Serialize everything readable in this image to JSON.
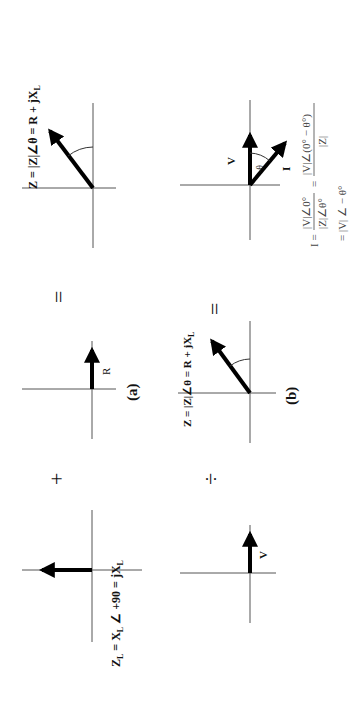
{
  "figure": {
    "rows": [
      {
        "caption": "(a)",
        "panels": [
          {
            "id": "xl",
            "label": "Z_L = X_L ∠ +90 = jX_L",
            "label_main": "Z",
            "label_sub": "L",
            "label_rest": " = X",
            "label_sub2": "L",
            "label_rest2": " ∠ +90 = jX",
            "label_sub3": "L",
            "vector": "jX_L"
          },
          {
            "id": "r",
            "label": "R",
            "vector": "R"
          },
          {
            "id": "z",
            "label": "Z = |Z|∠θ = R + jX_L",
            "label_text": "Z = |Z|∠θ = R + jX",
            "label_sub": "L",
            "vector": "Z"
          }
        ],
        "operators": [
          "+",
          "="
        ]
      },
      {
        "caption": "(b)",
        "panels": [
          {
            "id": "v",
            "label": "V",
            "vector": "V"
          },
          {
            "id": "z",
            "label": "Z = |Z|∠θ = R + jX_L",
            "label_text": "Z = |Z|∠θ = R + jX",
            "label_sub": "L",
            "vector": "Z"
          },
          {
            "id": "iv",
            "v_label": "V",
            "i_label": "I",
            "angle_label": "-θ"
          }
        ],
        "operators": [
          "÷",
          "="
        ]
      }
    ],
    "formula": {
      "lhs": "I =",
      "frac1_num": "|V|∠0°",
      "frac1_den": "|Z|∠θ°",
      "eq": "=",
      "frac2_num": "|V|∠(0° − θ°)",
      "frac2_den": "|Z|",
      "line2": "= |V| ∠ − θ°"
    }
  }
}
